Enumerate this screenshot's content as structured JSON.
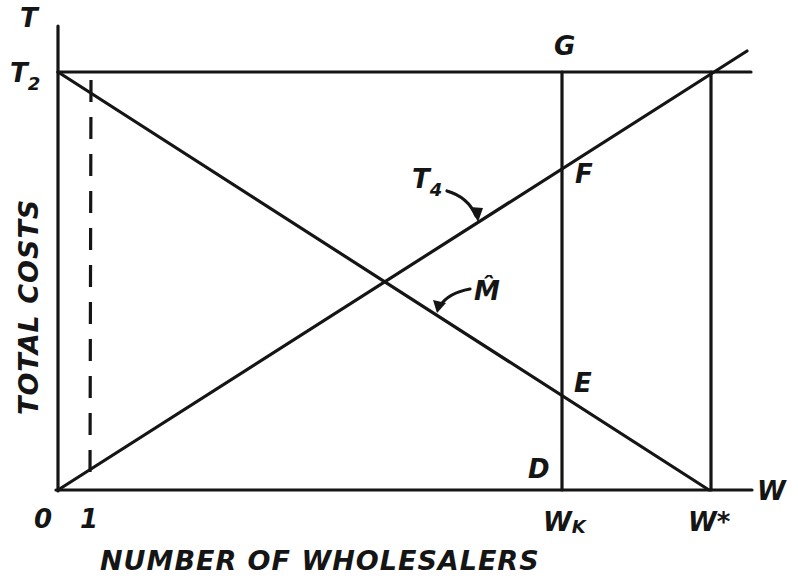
{
  "diagram": {
    "y_axis": {
      "symbol": "T",
      "title": "TOTAL COSTS"
    },
    "x_axis": {
      "symbol": "W",
      "title": "NUMBER OF WHOLESALERS"
    },
    "y_ticks": [
      {
        "label": "T",
        "subscript": "2"
      }
    ],
    "x_ticks": [
      {
        "label": "0"
      },
      {
        "label": "1"
      },
      {
        "label": "W",
        "subscript": "K"
      },
      {
        "label": "W*"
      }
    ],
    "curves": [
      {
        "id": "T4",
        "label": "T",
        "subscript": "4",
        "description": "rising total-cost line from origin"
      },
      {
        "id": "M_hat",
        "label": "M̂",
        "description": "falling line from T2 to W*"
      },
      {
        "id": "T2_level",
        "description": "horizontal line at T2"
      }
    ],
    "points": [
      "G",
      "F",
      "E",
      "D"
    ],
    "guides": [
      {
        "id": "dashed_at_1",
        "style": "dashed",
        "at": "1"
      },
      {
        "id": "vertical_Wk",
        "style": "solid",
        "at": "WK"
      },
      {
        "id": "vertical_Wstar",
        "style": "solid",
        "at": "W*"
      }
    ],
    "colors": {
      "ink": "#151515",
      "background": "#ffffff"
    }
  }
}
